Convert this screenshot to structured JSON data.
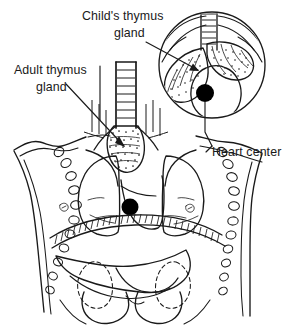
{
  "figure": {
    "background_color": "#ffffff",
    "ink_color": "#1a1a1a",
    "width": 294,
    "height": 332
  },
  "labels": {
    "child_thymus": "Child's thymus\ngland",
    "child_thymus_line1": "Child's thymus",
    "child_thymus_line2": "gland",
    "adult_thymus_line1": "Adult thymus",
    "adult_thymus_line2": "gland",
    "heart_center": "Heart center"
  },
  "markers": {
    "heart_center_dot_color": "#000000",
    "torso_dot_label": "heart-center-dot-torso",
    "inset_dot_label": "heart-center-dot-inset"
  },
  "parts": {
    "inset_circle": "child-thymus-inset-circle",
    "trachea": "trachea",
    "adult_thymus": "adult-thymus-gland",
    "child_thymus": "child-thymus-gland",
    "left_lung": "left-lung",
    "right_lung": "right-lung",
    "ribs": "rib-cage",
    "diaphragm": "diaphragm",
    "liver": "liver",
    "stomach": "stomach",
    "kidney_left": "kidney-left",
    "kidney_right": "kidney-right",
    "clavicle": "clavicle",
    "torso_outline": "torso-outline"
  }
}
